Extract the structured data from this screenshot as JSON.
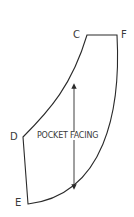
{
  "diagram": {
    "piece_name": "POCKET FACING",
    "points": [
      {
        "id": "C",
        "label": "C"
      },
      {
        "id": "F",
        "label": "F"
      },
      {
        "id": "D",
        "label": "D"
      },
      {
        "id": "E",
        "label": "E"
      }
    ],
    "grainline": {
      "direction": "vertical",
      "double_headed": true
    },
    "colors": {
      "line": "#2a2a2a",
      "text": "#3a3a3a",
      "background": "#ffffff"
    }
  }
}
